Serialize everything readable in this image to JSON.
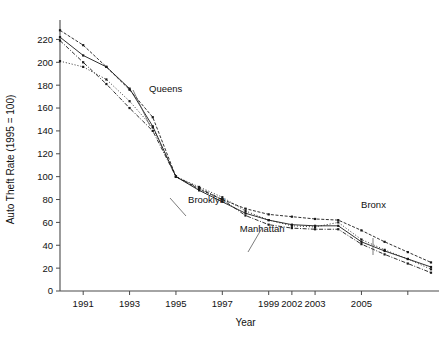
{
  "chart_data": {
    "type": "line",
    "title": "",
    "xlabel": "Year",
    "ylabel": "Auto Theft Rate (1995 = 100)",
    "xlim": [
      1990,
      2006
    ],
    "ylim": [
      0,
      230
    ],
    "grid": false,
    "legend_position": "inline-annotations",
    "x": [
      1990,
      1991,
      1992,
      1993,
      1994,
      1995,
      1996,
      1997,
      1998,
      1999,
      2000,
      2001,
      2002,
      2003,
      2004,
      2005,
      2006
    ],
    "xtick_values": [
      1991,
      1993,
      1995,
      1997,
      1999,
      2000,
      2001,
      2003,
      2005
    ],
    "xtick_labels": [
      "1991",
      "1993",
      "1995",
      "1997",
      "1999",
      "2002",
      "2003",
      "2005",
      ""
    ],
    "xtick_labels_visible": [
      "1991",
      "1993",
      "1995",
      "1997",
      "1999",
      "2002",
      "2003",
      "2005"
    ],
    "ytick_values": [
      0,
      20,
      40,
      60,
      80,
      100,
      120,
      140,
      160,
      180,
      200,
      220
    ],
    "ytick_labels": [
      "0",
      "20",
      "40",
      "60",
      "80",
      "100",
      "120",
      "140",
      "160",
      "180",
      "200",
      "220"
    ],
    "series": [
      {
        "name": "Bronx",
        "style": "dashed-dotted",
        "values": [
          228,
          215,
          196,
          176,
          152,
          100,
          89,
          80,
          72,
          67,
          65,
          63,
          62,
          53,
          43,
          34,
          25
        ]
      },
      {
        "name": "Queens",
        "style": "dotted",
        "values": [
          201,
          196,
          185,
          166,
          143,
          100,
          91,
          82,
          70,
          62,
          57,
          56,
          60,
          45,
          36,
          28,
          19
        ]
      },
      {
        "name": "Brooklyn",
        "style": "solid",
        "values": [
          222,
          206,
          196,
          177,
          144,
          100,
          88,
          78,
          68,
          62,
          58,
          57,
          57,
          43,
          35,
          28,
          21
        ]
      },
      {
        "name": "Manhattan",
        "style": "dash-dot",
        "values": [
          219,
          200,
          181,
          160,
          140,
          100,
          90,
          80,
          66,
          58,
          55,
          54,
          54,
          41,
          32,
          24,
          16
        ]
      }
    ],
    "annotations": [
      {
        "text": "Queens",
        "x_frac": 0.285,
        "y_frac": 0.245
      },
      {
        "text": "Brooklyn",
        "x_frac": 0.395,
        "y_frac": 0.665
      },
      {
        "text": "Manhattan",
        "x_frac": 0.545,
        "y_frac": 0.775
      },
      {
        "text": "Bronx",
        "x_frac": 0.845,
        "y_frac": 0.685
      }
    ]
  }
}
